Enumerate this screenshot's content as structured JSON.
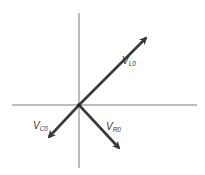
{
  "diagram": {
    "type": "phasor-diagram",
    "origin": [
      79,
      105
    ],
    "axes": {
      "horizontal": {
        "x1": 12,
        "y1": 105,
        "x2": 197,
        "y2": 105
      },
      "vertical": {
        "x1": 79,
        "y1": 13,
        "x2": 79,
        "y2": 168
      }
    },
    "vectors": [
      {
        "name": "V_L0",
        "main": "V",
        "sub": "L0",
        "to": [
          146,
          38
        ],
        "label_pos": [
          122,
          64
        ]
      },
      {
        "name": "V_C0",
        "main": "V",
        "sub": "C0",
        "to": [
          49,
          137
        ],
        "label_pos": [
          33,
          129
        ]
      },
      {
        "name": "V_R0",
        "main": "V",
        "sub": "R0",
        "to": [
          119,
          148
        ],
        "label_pos": [
          106,
          130
        ]
      }
    ],
    "colors": {
      "axis": "#7a7a7a",
      "vector": "#3a3a3a",
      "label": "#333333"
    }
  }
}
